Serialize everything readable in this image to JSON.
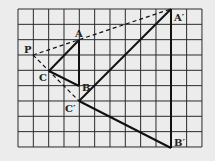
{
  "grid": {
    "cols": 12,
    "rows": 9,
    "x0": 18,
    "y0": 9,
    "cell": 15.33
  },
  "points": {
    "P": {
      "label": "P",
      "col": 1,
      "row": 3
    },
    "A": {
      "label": "A",
      "col": 4,
      "row": 2
    },
    "B": {
      "label": "B",
      "col": 4,
      "row": 5
    },
    "C": {
      "label": "C",
      "col": 2,
      "row": 4
    },
    "A_prime": {
      "label": "A′",
      "col": 10,
      "row": 0
    },
    "B_prime": {
      "label": "B′",
      "col": 10,
      "row": 9
    },
    "C_prime": {
      "label": "C′",
      "col": 4,
      "row": 6
    }
  },
  "colors": {
    "background": "#ececec",
    "grid": "#2a2a2a",
    "lines": "#111111"
  }
}
